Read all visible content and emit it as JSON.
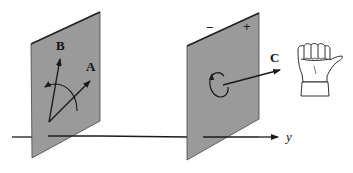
{
  "diagram": {
    "type": "vector-rotation-planes",
    "colors": {
      "plane_fill": "#9a9a9a",
      "plane_edge": "#333333",
      "line": "#1a1a1a",
      "background": "#ffffff"
    },
    "axis": {
      "label": "y"
    },
    "left_plane": {
      "vectors": [
        {
          "label": "B"
        },
        {
          "label": "A"
        }
      ],
      "rotation_arc": "A-to-B"
    },
    "right_plane": {
      "signs": {
        "minus": "−",
        "plus": "+"
      },
      "circulation": "counterclockwise",
      "normal_vector": {
        "label": "C"
      }
    },
    "hand": {
      "icon": "right-hand-thumb-icon"
    }
  }
}
